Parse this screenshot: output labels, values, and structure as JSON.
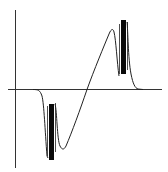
{
  "diagram": {
    "title": "",
    "colors": {
      "background": "#ffffff",
      "axis": "#333333",
      "curve": "#222222",
      "burst": "#0a0a0a"
    },
    "components": [
      {
        "id": "y-axis",
        "label": ""
      },
      {
        "id": "x-axis",
        "label": ""
      },
      {
        "id": "waveform",
        "label": ""
      },
      {
        "id": "negative-burst",
        "label": ""
      },
      {
        "id": "positive-burst",
        "label": ""
      }
    ]
  }
}
